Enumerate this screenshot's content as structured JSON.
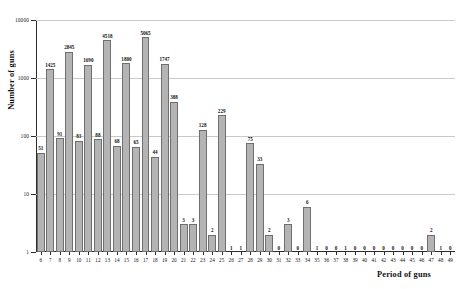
{
  "chart_data": {
    "type": "bar",
    "title": "",
    "xlabel": "Period of guns",
    "ylabel": "Number of guns",
    "yscale": "log",
    "ylim": [
      1,
      10000
    ],
    "ytick_labels": [
      "1",
      "10",
      "100",
      "1000",
      "10000"
    ],
    "ytick_values": [
      1,
      10,
      100,
      1000,
      10000
    ],
    "grid": true,
    "legend": "none",
    "categories": [
      6,
      7,
      8,
      9,
      10,
      11,
      12,
      13,
      14,
      15,
      16,
      17,
      18,
      19,
      20,
      21,
      22,
      23,
      24,
      25,
      26,
      27,
      28,
      29,
      30,
      31,
      32,
      33,
      34,
      35,
      36,
      37,
      38,
      39,
      40,
      41,
      42,
      43,
      44,
      45,
      46,
      47,
      48,
      49
    ],
    "values": [
      51,
      1425,
      91,
      2845,
      83,
      1690,
      88,
      4518,
      68,
      1800,
      65,
      5065,
      44,
      1747,
      388,
      3,
      3,
      128,
      2,
      229,
      1,
      1,
      75,
      33,
      2,
      0,
      3,
      0,
      6,
      1,
      0,
      0,
      1,
      0,
      0,
      0,
      0,
      0,
      0,
      0,
      0,
      2,
      1,
      0
    ],
    "bar_labels": [
      "51",
      "1425",
      "91",
      "2845",
      "83",
      "1690",
      "88",
      "4518",
      "68",
      "1800",
      "65",
      "5065",
      "44",
      "1747",
      "388",
      "3",
      "3",
      "128",
      "2",
      "229",
      "1",
      "1",
      "75",
      "33",
      "2",
      "0",
      "3",
      "0",
      "6",
      "1",
      "0",
      "0",
      "1",
      "0",
      "0",
      "0",
      "0",
      "0",
      "0",
      "0",
      "0",
      "2",
      "1",
      "0"
    ],
    "bar_color": "#b4b4b4",
    "bar_edge_color": "#6f6f6f",
    "grid_color": "#c9c9c9",
    "axis_color": "#2b2b2b"
  }
}
